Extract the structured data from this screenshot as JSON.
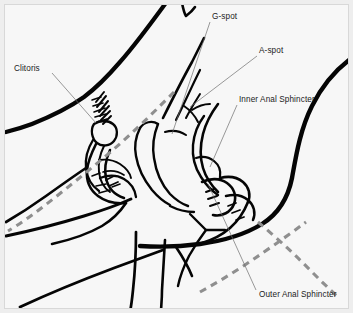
{
  "figure": {
    "kind": "anatomical-line-drawing",
    "background_color": "#f7f7f7",
    "border_color": "#eeeeee",
    "ink_color": "#050505",
    "leader_color": "#6e6e6e",
    "dashed_guide_color": "#8f8f8f"
  },
  "labels": {
    "clitoris": "Clitoris",
    "g_spot": "G-spot",
    "a_spot": "A-spot",
    "inner_anal_sphincter": "Inner Anal Sphincter",
    "outer_anal_sphincter": "Outer Anal Sphincter"
  },
  "annotations": [
    {
      "id": "clitoris",
      "text": "Clitoris",
      "text_x": 14,
      "text_y": 71,
      "leader_from_x": 52,
      "leader_from_y": 73,
      "leader_to_x": 96,
      "leader_to_y": 123
    },
    {
      "id": "g-spot",
      "text": "G-spot",
      "text_x": 212,
      "text_y": 19,
      "leader_from_x": 210,
      "leader_from_y": 22,
      "leader_to_x": 172,
      "leader_to_y": 134
    },
    {
      "id": "a-spot",
      "text": "A-spot",
      "text_x": 259,
      "text_y": 53,
      "leader_from_x": 257,
      "leader_from_y": 56,
      "leader_to_x": 190,
      "leader_to_y": 107
    },
    {
      "id": "inner-anal-sphincter",
      "text": "Inner Anal Sphincter",
      "text_x": 239,
      "text_y": 102,
      "leader_from_x": 237,
      "leader_from_y": 105,
      "leader_to_x": 210,
      "leader_to_y": 167
    },
    {
      "id": "outer-anal-sphincter",
      "text": "Outer Anal Sphincter",
      "text_x": 259,
      "text_y": 297,
      "leader_from_x": 256,
      "leader_from_y": 290,
      "leader_to_x": 208,
      "leader_to_y": 184
    }
  ],
  "guides": {
    "upper_dashed_label": "upper insertion guide",
    "lower_dashed_label": "lower insertion guide"
  }
}
